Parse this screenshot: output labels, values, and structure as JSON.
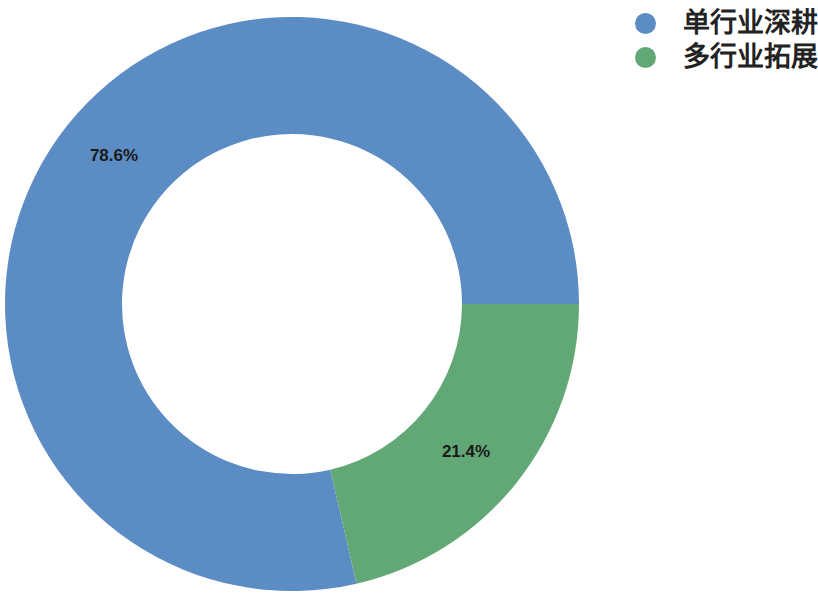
{
  "chart_data": {
    "type": "pie",
    "variant": "donut",
    "title": "",
    "subtitle": "",
    "xlabel": "",
    "ylabel": "",
    "legend_position": "top-right",
    "grid": false,
    "background_color": "#FFFFFF",
    "categories": [
      "单行业深耕",
      "多行业拓展"
    ],
    "values": [
      78.6,
      21.4
    ],
    "value_labels": [
      "78.6%",
      "21.4%"
    ],
    "colors": [
      "#5B8CC4",
      "#62A877"
    ],
    "slices": [
      {
        "name": "单行业深耕",
        "value": 78.6,
        "label": "78.6%",
        "color": "#5B8CC4",
        "start_angle_deg": 167.0,
        "end_angle_deg": 450.0,
        "label_x": 114,
        "label_y": 157
      },
      {
        "name": "多行业拓展",
        "value": 21.4,
        "label": "21.4%",
        "color": "#62A877",
        "start_angle_deg": 90.0,
        "end_angle_deg": 167.0,
        "label_x": 466,
        "label_y": 453
      }
    ],
    "geometry": {
      "center_x": 292,
      "center_y": 304,
      "outer_radius": 287,
      "inner_radius": 170
    }
  },
  "legend": {
    "items": [
      {
        "label": "单行业深耕",
        "color": "#5B8CC4",
        "marker": "circle-marker"
      },
      {
        "label": "多行业拓展",
        "color": "#62A877",
        "marker": "circle-marker"
      }
    ]
  }
}
